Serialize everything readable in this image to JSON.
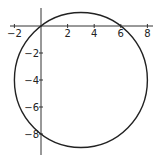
{
  "chart_data": {
    "type": "line",
    "title": "",
    "xlabel": "",
    "ylabel": "",
    "center": [
      3,
      -4
    ],
    "radius": 5,
    "points_on_curve": [
      [
        0,
        0
      ],
      [
        6,
        0
      ],
      [
        0,
        -8
      ]
    ],
    "xlim": [
      -2.3,
      8.4
    ],
    "ylim": [
      -9.6,
      1.3
    ],
    "x_ticks": [
      -2,
      2,
      4,
      6,
      8
    ],
    "y_ticks": [
      -2,
      -4,
      -6,
      -8
    ],
    "x_tick_labels": [
      "−2",
      "2",
      "4",
      "6",
      "8"
    ],
    "y_tick_labels": [
      "−2",
      "−4",
      "−6",
      "−8"
    ],
    "grid": false,
    "legend": null,
    "colors": {
      "curve": "#222222",
      "axes": "#333333"
    }
  }
}
